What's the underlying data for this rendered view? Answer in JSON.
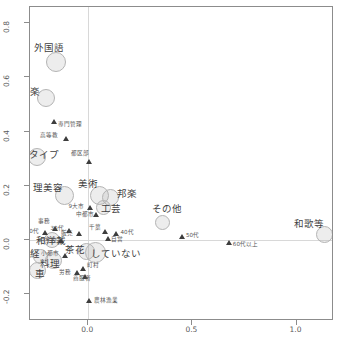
{
  "chart_data": {
    "type": "scatter",
    "title": "",
    "xlabel": "",
    "ylabel": "",
    "xlim": [
      -0.28,
      1.18
    ],
    "ylim": [
      -0.3,
      0.86
    ],
    "grid": true,
    "legend": "none",
    "xticks": [
      "0.0",
      "0.5",
      "1.0"
    ],
    "xtick_values": [
      0.0,
      0.5,
      1.0
    ],
    "yticks": [
      "0.8",
      "0.6",
      "0.4",
      "0.2",
      "0.0",
      "-0.2"
    ],
    "ytick_values": [
      0.8,
      0.6,
      0.4,
      0.2,
      0.0,
      -0.2
    ],
    "series": [
      {
        "name": "activities",
        "marker": "bubble",
        "points": [
          {
            "label": "外国語",
            "x": -0.155,
            "y": 0.655,
            "size": 20,
            "label_dx": -22,
            "label_dy": -14
          },
          {
            "label": "洋楽",
            "x": -0.205,
            "y": 0.525,
            "size": 18,
            "label_dx": -26,
            "label_dy": -6
          },
          {
            "label": "タイプ",
            "x": -0.245,
            "y": 0.305,
            "size": 18,
            "label_dx": -8,
            "label_dy": -2
          },
          {
            "label": "理美容",
            "x": -0.115,
            "y": 0.165,
            "size": 19,
            "label_dx": -31,
            "label_dy": -7
          },
          {
            "label": "美術",
            "x": 0.055,
            "y": 0.165,
            "size": 19,
            "label_dx": -22,
            "label_dy": -11
          },
          {
            "label": "邦楽",
            "x": 0.105,
            "y": 0.155,
            "size": 17,
            "label_dx": 7,
            "label_dy": -4
          },
          {
            "label": "工芸",
            "x": 0.075,
            "y": 0.12,
            "size": 15,
            "label_dx": -3,
            "label_dy": 2
          },
          {
            "label": "その他",
            "x": 0.355,
            "y": 0.065,
            "size": 15,
            "label_dx": -10,
            "label_dy": -13
          },
          {
            "label": "和歌等",
            "x": 1.135,
            "y": 0.02,
            "size": 17,
            "label_dx": -31,
            "label_dy": -10
          },
          {
            "label": "和洋裁",
            "x": -0.175,
            "y": 0.0,
            "size": 16,
            "label_dx": -16,
            "label_dy": 1
          },
          {
            "label": "茶花",
            "x": -0.01,
            "y": -0.045,
            "size": 17,
            "label_dx": -21,
            "label_dy": -2
          },
          {
            "label": "していない",
            "x": 0.035,
            "y": -0.048,
            "size": 21,
            "label_dx": -5,
            "label_dy": 1
          },
          {
            "label": "編経",
            "x": -0.23,
            "y": -0.06,
            "size": 15,
            "label_dx": -20,
            "label_dy": -2
          },
          {
            "label": "料理",
            "x": -0.165,
            "y": -0.075,
            "size": 17,
            "label_dx": -14,
            "label_dy": 4
          },
          {
            "label": "車",
            "x": -0.245,
            "y": -0.115,
            "size": 17,
            "label_dx": -2,
            "label_dy": 3
          }
        ]
      },
      {
        "name": "demographics",
        "marker": "triangle",
        "points": [
          {
            "label": "専門管理",
            "x": -0.165,
            "y": 0.435,
            "label_dx": 4,
            "label_dy": 3
          },
          {
            "label": "高等教",
            "x": -0.105,
            "y": 0.375,
            "label_dx": -26,
            "label_dy": -2
          },
          {
            "label": "都区部",
            "x": 0.005,
            "y": 0.29,
            "label_dx": -18,
            "label_dy": -7
          },
          {
            "label": "9大市",
            "x": 0.01,
            "y": 0.12,
            "label_dx": -22,
            "label_dy": 0
          },
          {
            "label": "中都市",
            "x": 0.04,
            "y": 0.093,
            "label_dx": -21,
            "label_dy": 0
          },
          {
            "label": "事務",
            "x": -0.16,
            "y": 0.04,
            "label_dx": -17,
            "label_dy": -7
          },
          {
            "label": "20代",
            "x": -0.205,
            "y": 0.025,
            "label_dx": -20,
            "label_dy": -1
          },
          {
            "label": "30代",
            "x": -0.09,
            "y": 0.032,
            "label_dx": -19,
            "label_dy": -2
          },
          {
            "label": "販売",
            "x": -0.045,
            "y": 0.022,
            "label_dx": -18,
            "label_dy": 0
          },
          {
            "label": "千葉",
            "x": 0.08,
            "y": 0.03,
            "label_dx": -16,
            "label_dy": -4
          },
          {
            "label": "40代",
            "x": 0.135,
            "y": 0.022,
            "label_dx": 4,
            "label_dy": -1
          },
          {
            "label": "自営",
            "x": 0.095,
            "y": 0.005,
            "label_dx": 3,
            "label_dy": 2
          },
          {
            "label": "中学校",
            "x": -0.13,
            "y": -0.005,
            "label_dx": -22,
            "label_dy": 0
          },
          {
            "label": "50代",
            "x": 0.45,
            "y": 0.012,
            "label_dx": 4,
            "label_dy": -1
          },
          {
            "label": "60代以上",
            "x": 0.675,
            "y": -0.01,
            "label_dx": 4,
            "label_dy": 2
          },
          {
            "label": "小都市",
            "x": -0.11,
            "y": -0.06,
            "label_dx": -24,
            "label_dy": -2
          },
          {
            "label": "町村",
            "x": -0.025,
            "y": -0.105,
            "label_dx": 4,
            "label_dy": -2
          },
          {
            "label": "労務",
            "x": -0.055,
            "y": -0.12,
            "label_dx": -18,
            "label_dy": 1
          },
          {
            "label": "商服者",
            "x": -0.015,
            "y": -0.135,
            "label_dx": -12,
            "label_dy": 3
          },
          {
            "label": "農林漁業",
            "x": 0.005,
            "y": -0.225,
            "label_dx": 5,
            "label_dy": 0
          }
        ]
      }
    ]
  },
  "colors": {
    "frame": "#8c8c8c",
    "grid": "#d8d8d8",
    "bubble_fill": "rgba(175,175,175,0.22)",
    "bubble_stroke": "#b4b4b4",
    "triangle": "#3d3d3d",
    "text": "#4f4f4f"
  }
}
